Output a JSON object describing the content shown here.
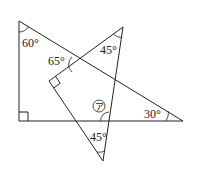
{
  "diagram": {
    "type": "geometry",
    "labels": {
      "angle_top_left": "60°",
      "angle_65": "65°",
      "angle_top_right": "45°",
      "angle_right": "30°",
      "angle_bottom": "45°",
      "unknown_marker": "ア"
    },
    "triangle1": {
      "vertices": [
        [
          19,
          21
        ],
        [
          19,
          121
        ],
        [
          183,
          121
        ]
      ],
      "right_angle_at": [
        19,
        121
      ]
    },
    "triangle2": {
      "vertices": [
        [
          123,
          27
        ],
        [
          49,
          81
        ],
        [
          103,
          161
        ]
      ],
      "right_angle_at": [
        49,
        81
      ]
    }
  }
}
